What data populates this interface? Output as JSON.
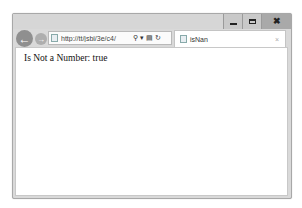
{
  "window": {
    "controls": {
      "minimize": "minimize-icon",
      "maximize": "maximize-icon",
      "close": "close-icon",
      "close_glyph": "✖"
    }
  },
  "toolbar": {
    "back_glyph": "←",
    "forward_glyph": "→",
    "address": {
      "url": "http://tt/jsbi/3e/c4/",
      "search_glyph": "⚲",
      "dropdown_glyph": "▾",
      "compat_glyph": "▤",
      "refresh_glyph": "↻"
    }
  },
  "tabs": [
    {
      "title": "isNan",
      "close_glyph": "×",
      "active": true
    }
  ],
  "page": {
    "text": "Is Not a Number: true"
  }
}
